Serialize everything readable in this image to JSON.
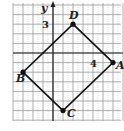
{
  "figure": {
    "type": "coordinate-plane-quadrilateral",
    "axes": {
      "y_label": "y",
      "tick_labels": {
        "y": "3",
        "x": "4"
      }
    },
    "grid": {
      "x_min": -4,
      "x_max": 7,
      "y_min": -7,
      "y_max": 5,
      "color": "#999999"
    },
    "points": [
      {
        "name": "A",
        "x": 6,
        "y": -1
      },
      {
        "name": "B",
        "x": -3,
        "y": -2
      },
      {
        "name": "C",
        "x": 1,
        "y": -6
      },
      {
        "name": "D",
        "x": 2,
        "y": 3
      }
    ],
    "polygon_order": [
      "D",
      "A",
      "C",
      "B"
    ],
    "line_color": "#111111"
  }
}
